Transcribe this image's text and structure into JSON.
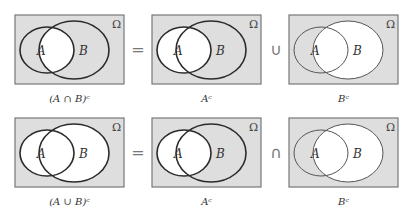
{
  "colors": {
    "shaded": "#dedede",
    "unshaded": "#ffffff",
    "outline": "#777777",
    "circle_bold": "#2b2b2b",
    "circle_light": "#555555"
  },
  "universe_symbol": "Ω",
  "set_labels": {
    "a": "A",
    "b": "B"
  },
  "rows": [
    {
      "name": "de-morgan-intersection",
      "operator_equals": "=",
      "operator_combine": "∪",
      "diagrams": [
        {
          "caption": "(A ∩ B)ᶜ",
          "shaded_regions": [
            "outside",
            "a_only",
            "b_only"
          ],
          "bold_circles": [
            "a",
            "b"
          ]
        },
        {
          "caption": "Aᶜ",
          "shaded_regions": [
            "outside",
            "b_only"
          ],
          "bold_circles": [
            "a",
            "b"
          ]
        },
        {
          "caption": "Bᶜ",
          "shaded_regions": [
            "outside",
            "a_only"
          ],
          "bold_circles": []
        }
      ]
    },
    {
      "name": "de-morgan-union",
      "operator_equals": "=",
      "operator_combine": "∩",
      "diagrams": [
        {
          "caption": "(A ∪ B)ᶜ",
          "shaded_regions": [
            "outside"
          ],
          "bold_circles": [
            "a",
            "b"
          ]
        },
        {
          "caption": "Aᶜ",
          "shaded_regions": [
            "outside",
            "b_only"
          ],
          "bold_circles": [
            "a",
            "b"
          ]
        },
        {
          "caption": "Bᶜ",
          "shaded_regions": [
            "outside",
            "a_only"
          ],
          "bold_circles": []
        }
      ]
    }
  ]
}
